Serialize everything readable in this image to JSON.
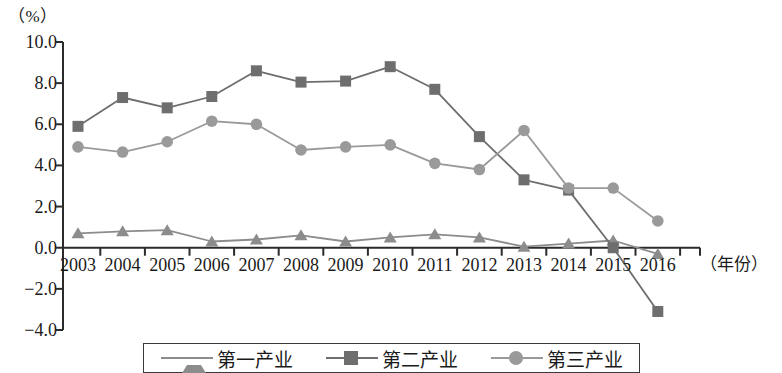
{
  "chart_data": {
    "type": "line",
    "title": "",
    "unit_label": "（%）",
    "xlabel": "（年份）",
    "ylabel": "",
    "x": [
      2003,
      2004,
      2005,
      2006,
      2007,
      2008,
      2009,
      2010,
      2011,
      2012,
      2013,
      2014,
      2015,
      2016
    ],
    "categories": [
      "2003",
      "2004",
      "2005",
      "2006",
      "2007",
      "2008",
      "2009",
      "2010",
      "2011",
      "2012",
      "2013",
      "2014",
      "2015",
      "2016"
    ],
    "ylim": [
      -4.0,
      10.0
    ],
    "yticks": [
      "10.0",
      "8.0",
      "6.0",
      "4.0",
      "2.0",
      "0.0",
      "−2.0",
      "−4.0"
    ],
    "ytick_values": [
      10.0,
      8.0,
      6.0,
      4.0,
      2.0,
      0.0,
      -2.0,
      -4.0
    ],
    "grid": false,
    "legend_position": "bottom",
    "series": [
      {
        "name": "第一产业",
        "marker": "triangle",
        "color": "#8c8c8c",
        "values": [
          0.7,
          0.8,
          0.85,
          0.3,
          0.4,
          0.6,
          0.3,
          0.5,
          0.65,
          0.5,
          0.05,
          0.2,
          0.35,
          -0.3
        ]
      },
      {
        "name": "第二产业",
        "marker": "square",
        "color": "#6e6e6e",
        "values": [
          5.9,
          7.3,
          6.8,
          7.35,
          8.6,
          8.05,
          8.1,
          8.8,
          7.7,
          5.4,
          3.3,
          2.8,
          0.0,
          -3.1
        ]
      },
      {
        "name": "第三产业",
        "marker": "circle",
        "color": "#9a9a9a",
        "values": [
          4.9,
          4.65,
          5.15,
          6.15,
          6.0,
          4.75,
          4.9,
          5.0,
          4.1,
          3.8,
          5.7,
          2.9,
          2.9,
          1.3
        ]
      }
    ]
  },
  "legend": {
    "items": [
      {
        "label": "第一产业",
        "marker": "triangle"
      },
      {
        "label": "第二产业",
        "marker": "square"
      },
      {
        "label": "第三产业",
        "marker": "circle"
      }
    ]
  },
  "axis": {
    "unit": "（%）",
    "x_title": "（年份）"
  }
}
